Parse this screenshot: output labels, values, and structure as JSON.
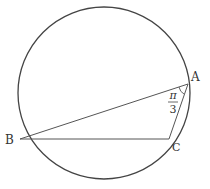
{
  "diagram": {
    "type": "geometry",
    "circle": {
      "cx": 104,
      "cy": 93,
      "r": 86
    },
    "points": {
      "A": {
        "label": "A",
        "x": 188,
        "y": 84
      },
      "B": {
        "label": "B",
        "x": 20,
        "y": 139
      },
      "C": {
        "label": "C",
        "x": 169,
        "y": 139
      }
    },
    "angle_label": {
      "numerator": "π",
      "denominator": "3",
      "at": "A"
    },
    "colors": {
      "stroke": "#444444",
      "text": "#333333"
    }
  }
}
